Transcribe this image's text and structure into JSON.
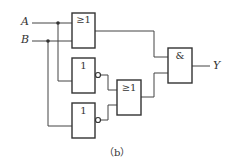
{
  "inputs": {
    "a": "A",
    "b": "B"
  },
  "output": "Y",
  "gates": {
    "or_top": "≥1",
    "not_1": "1",
    "not_2": "1",
    "or_mid": "≥1",
    "and": "&"
  },
  "caption": "（b）",
  "colors": {
    "line": "#444444",
    "background": "#ffffff"
  }
}
